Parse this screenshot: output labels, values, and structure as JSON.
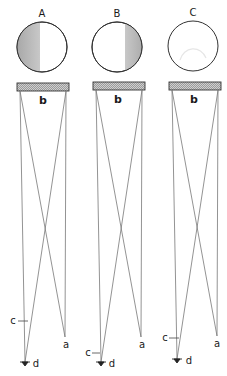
{
  "figure": {
    "panels": [
      {
        "id": "A",
        "label": "A",
        "shading": "left",
        "bar_label": "b",
        "point_a_label": "a",
        "point_c_label": "c",
        "point_d_label": "d"
      },
      {
        "id": "B",
        "label": "B",
        "shading": "right",
        "bar_label": "b",
        "point_a_label": "a",
        "point_c_label": "c",
        "point_d_label": "d"
      },
      {
        "id": "C",
        "label": "C",
        "shading": "none",
        "bar_label": "b",
        "point_a_label": "a",
        "point_c_label": "c",
        "point_d_label": "d"
      }
    ],
    "colors": {
      "line": "#777777",
      "outline": "#333333",
      "shade": "#b8b8b8",
      "text": "#1a1a1a"
    }
  }
}
